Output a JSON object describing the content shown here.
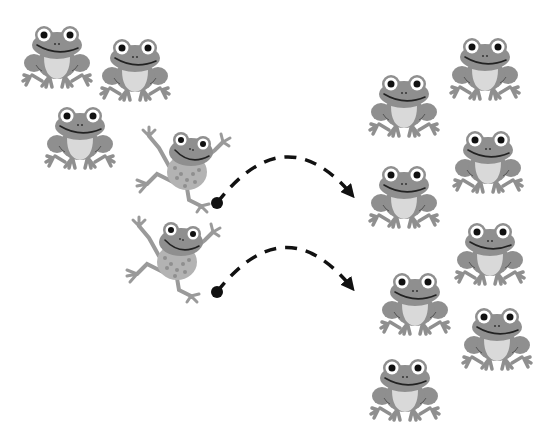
{
  "scene": {
    "description": "Clip-art illustration: three frogs sit on the left, two frogs jump to the right along dashed arrows, eight frogs sit on the right",
    "colors": {
      "background": "#ffffff",
      "frog_body": "#8f8f8f",
      "frog_belly": "#d9d9d9",
      "frog_spots": "#b3b3b3",
      "frog_eye_white": "#ffffff",
      "frog_pupil": "#111111",
      "mouth": "#222222",
      "arrow": "#111111"
    },
    "left_group": {
      "label": "Sitting frogs (left)",
      "count": 3,
      "frogs": [
        {
          "x": 22,
          "y": 25,
          "w": 70,
          "h": 62
        },
        {
          "x": 100,
          "y": 38,
          "w": 70,
          "h": 64
        },
        {
          "x": 45,
          "y": 106,
          "w": 70,
          "h": 64
        }
      ]
    },
    "jumping_group": {
      "label": "Jumping frogs",
      "count": 2,
      "frogs": [
        {
          "x": 135,
          "y": 125,
          "w": 95,
          "h": 88
        },
        {
          "x": 125,
          "y": 215,
          "w": 100,
          "h": 90
        }
      ]
    },
    "arrows": [
      {
        "start": [
          217,
          203
        ],
        "control": [
          285,
          120
        ],
        "end": [
          355,
          197
        ]
      },
      {
        "start": [
          217,
          292
        ],
        "control": [
          285,
          210
        ],
        "end": [
          355,
          290
        ]
      }
    ],
    "right_group": {
      "label": "Sitting frogs (right)",
      "count": 8,
      "frogs": [
        {
          "x": 450,
          "y": 37,
          "w": 70,
          "h": 64
        },
        {
          "x": 368,
          "y": 73,
          "w": 72,
          "h": 66
        },
        {
          "x": 453,
          "y": 130,
          "w": 70,
          "h": 66
        },
        {
          "x": 368,
          "y": 164,
          "w": 72,
          "h": 66
        },
        {
          "x": 455,
          "y": 222,
          "w": 70,
          "h": 66
        },
        {
          "x": 380,
          "y": 272,
          "w": 70,
          "h": 66
        },
        {
          "x": 462,
          "y": 307,
          "w": 70,
          "h": 66
        },
        {
          "x": 370,
          "y": 358,
          "w": 70,
          "h": 66
        }
      ]
    }
  }
}
